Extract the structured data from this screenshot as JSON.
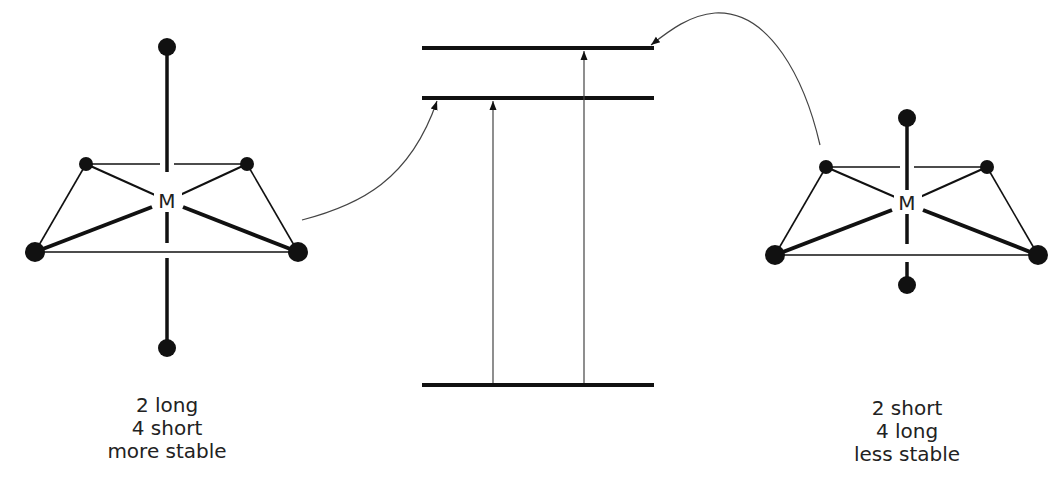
{
  "diagram": {
    "type": "jahn-teller-distortion",
    "center_atom_label": "M",
    "left_complex": {
      "description": "tetragonally elongated octahedron",
      "caption": [
        "2 long",
        "4 short",
        "more stable"
      ]
    },
    "right_complex": {
      "description": "tetragonally compressed octahedron",
      "caption": [
        "2 short",
        "4 long",
        "less stable"
      ]
    },
    "energy_levels": [
      {
        "name": "upper-level",
        "relative": "highest"
      },
      {
        "name": "middle-level",
        "relative": "middle"
      },
      {
        "name": "ground-level",
        "relative": "lowest"
      }
    ],
    "transitions": [
      {
        "from": "ground-level",
        "to": "middle-level"
      },
      {
        "from": "ground-level",
        "to": "upper-level"
      }
    ],
    "links": [
      {
        "from": "left_complex",
        "to": "middle-level"
      },
      {
        "from": "right_complex",
        "to": "upper-level"
      }
    ],
    "colors": {
      "line": "#111111",
      "thin_line": "#444444",
      "text": "#222222"
    }
  }
}
